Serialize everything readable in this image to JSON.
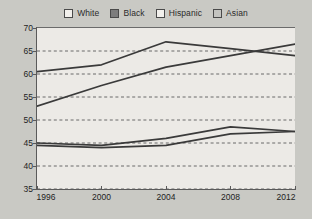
{
  "legend": {
    "position": "top-center",
    "items": [
      {
        "label": "White",
        "swatch_color": "#f2f0ec",
        "icon": "legend-swatch-icon"
      },
      {
        "label": "Black",
        "swatch_color": "#7d7d7d",
        "icon": "legend-swatch-icon"
      },
      {
        "label": "Hispanic",
        "swatch_color": "#f2f0ec",
        "icon": "legend-swatch-icon"
      },
      {
        "label": "Asian",
        "swatch_color": "#c4c4c0",
        "icon": "legend-swatch-icon"
      }
    ]
  },
  "axes": {
    "y_ticks": [
      "70",
      "65",
      "60",
      "55",
      "50",
      "45",
      "40",
      "35"
    ],
    "x_ticks": [
      "1996",
      "2000",
      "2004",
      "2008",
      "2012"
    ]
  },
  "chart_data": {
    "type": "line",
    "title": "",
    "subtitle": "",
    "xlabel": "",
    "ylabel": "",
    "x": [
      1996,
      2000,
      2004,
      2008,
      2012
    ],
    "categories": [
      "1996",
      "2000",
      "2004",
      "2008",
      "2012"
    ],
    "xlim": [
      1996,
      2012
    ],
    "ylim": [
      35,
      70
    ],
    "y_tick_values": [
      35,
      40,
      45,
      50,
      55,
      60,
      65,
      70
    ],
    "grid": "horizontal-dashed",
    "legend_position": "top-center",
    "line_color": "#3a3a3a",
    "plot_background": "#eceae6",
    "figure_background": "#c9c9c4",
    "series": [
      {
        "name": "White",
        "values": [
          60.5,
          62.0,
          67.0,
          65.5,
          64.0
        ]
      },
      {
        "name": "Black",
        "values": [
          53.0,
          57.5,
          61.5,
          64.0,
          66.5
        ]
      },
      {
        "name": "Hispanic",
        "values": [
          45.0,
          44.5,
          46.0,
          48.5,
          47.5
        ]
      },
      {
        "name": "Asian",
        "values": [
          44.5,
          44.0,
          44.5,
          47.0,
          47.5
        ]
      }
    ]
  }
}
